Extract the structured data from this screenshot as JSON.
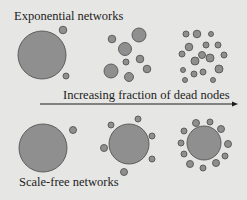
{
  "labels": {
    "top": "Exponential networks",
    "arrow": "Increasing fraction of dead nodes",
    "bottom": "Scale-free networks"
  },
  "colors": {
    "background": "#e6e6e4",
    "node_fill": "#8f8f8f",
    "node_stroke": "#555555",
    "text": "#1c1c1c"
  },
  "diagram": {
    "rows": [
      {
        "name": "Exponential networks",
        "stages": 3
      },
      {
        "name": "Scale-free networks",
        "stages": 3
      }
    ],
    "arrow": {
      "direction": "right",
      "meaning": "Increasing fraction of dead nodes"
    }
  }
}
